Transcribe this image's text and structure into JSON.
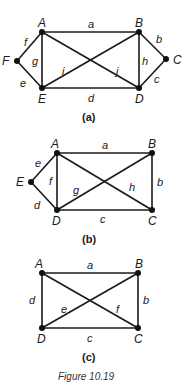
{
  "figure": {
    "caption": "Figure 10.19",
    "graphs": [
      {
        "id": "a",
        "sublabel": "(a)",
        "vertices": [
          "A",
          "B",
          "C",
          "D",
          "E",
          "F"
        ],
        "edges": [
          {
            "label": "a",
            "from": "A",
            "to": "B"
          },
          {
            "label": "b",
            "from": "B",
            "to": "C"
          },
          {
            "label": "c",
            "from": "C",
            "to": "D"
          },
          {
            "label": "d",
            "from": "D",
            "to": "E"
          },
          {
            "label": "e",
            "from": "E",
            "to": "F"
          },
          {
            "label": "f",
            "from": "F",
            "to": "A"
          },
          {
            "label": "g",
            "from": "A",
            "to": "E"
          },
          {
            "label": "h",
            "from": "B",
            "to": "D"
          },
          {
            "label": "i",
            "from": "E",
            "to": "B"
          },
          {
            "label": "j",
            "from": "A",
            "to": "D"
          }
        ]
      },
      {
        "id": "b",
        "sublabel": "(b)",
        "vertices": [
          "A",
          "B",
          "C",
          "D",
          "E"
        ],
        "edges": [
          {
            "label": "a",
            "from": "A",
            "to": "B"
          },
          {
            "label": "b",
            "from": "B",
            "to": "C"
          },
          {
            "label": "c",
            "from": "C",
            "to": "D"
          },
          {
            "label": "d",
            "from": "D",
            "to": "E"
          },
          {
            "label": "e",
            "from": "E",
            "to": "A"
          },
          {
            "label": "f",
            "from": "A",
            "to": "D"
          },
          {
            "label": "g",
            "from": "D",
            "to": "B"
          },
          {
            "label": "h",
            "from": "A",
            "to": "C"
          }
        ]
      },
      {
        "id": "c",
        "sublabel": "(c)",
        "vertices": [
          "A",
          "B",
          "C",
          "D"
        ],
        "edges": [
          {
            "label": "a",
            "from": "A",
            "to": "B"
          },
          {
            "label": "b",
            "from": "B",
            "to": "C"
          },
          {
            "label": "c",
            "from": "C",
            "to": "D"
          },
          {
            "label": "d",
            "from": "D",
            "to": "A"
          },
          {
            "label": "e",
            "from": "D",
            "to": "B"
          },
          {
            "label": "f",
            "from": "A",
            "to": "C"
          }
        ]
      }
    ]
  }
}
